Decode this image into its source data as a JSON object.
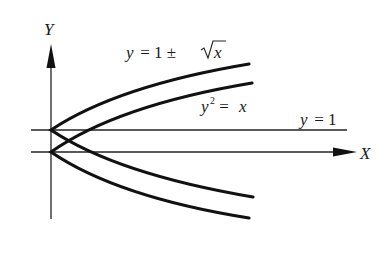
{
  "diagram": {
    "axes": {
      "x_label": "X",
      "y_label": "Y",
      "origin_px": [
        51,
        152
      ],
      "unit_px": 22
    },
    "labels": {
      "upper_curve": {
        "lhs": "y",
        "eq": " = 1 ± ",
        "sqrt_arg": "x"
      },
      "parabola": {
        "lhs": "y",
        "exp": "2",
        "eq": " = ",
        "rhs": "x"
      },
      "line": {
        "lhs": "y",
        "eq": " = 1"
      }
    },
    "curves": [
      {
        "name": "y = 1 ± √x",
        "x_max": 9.3
      },
      {
        "name": "y² = x",
        "y_range": [
          -3,
          3.1
        ]
      },
      {
        "name": "y = 1",
        "x_range": [
          -0.9,
          13.5
        ]
      }
    ],
    "colors": {
      "ink": "#111111",
      "thin": "#222222"
    }
  }
}
